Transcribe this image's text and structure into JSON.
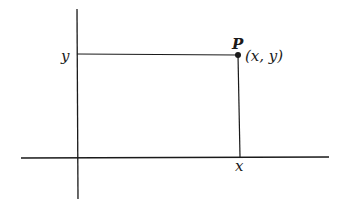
{
  "diagram": {
    "point_label": "P",
    "coord_label": "(x, y)",
    "x_tick_label": "x",
    "y_tick_label": "y",
    "colors": {
      "ink": "#1a1a1a",
      "background": "#ffffff"
    }
  }
}
